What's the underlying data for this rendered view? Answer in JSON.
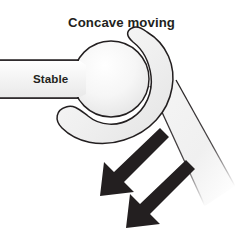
{
  "figure": {
    "title": "Concave moving",
    "background_color": "#ffffff",
    "outline_color": "#231f20",
    "fill_light": "#f2f2f2",
    "fill_highlight": "#fdfdfd",
    "arrow_color": "#231f20"
  },
  "labels": {
    "title": "Concave moving",
    "stable": "Stable"
  },
  "parts": {
    "ball": "convex-bone-head",
    "socket": "concave-bone-socket",
    "stable_segment": "stable-bone-shaft",
    "moving_segment": "moving-bone-shaft"
  },
  "arrows": [
    {
      "name": "motion-arrow-upper",
      "direction": "down-left"
    },
    {
      "name": "motion-arrow-lower",
      "direction": "down-left"
    }
  ]
}
